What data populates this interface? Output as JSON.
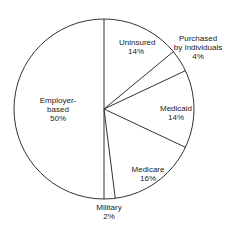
{
  "chart_data": {
    "type": "pie",
    "title": "",
    "slices": [
      {
        "label": "Uninsured",
        "value": 14
      },
      {
        "label": "Purchased by Individuals",
        "value": 4
      },
      {
        "label": "Medicaid",
        "value": 14
      },
      {
        "label": "Medicare",
        "value": 16
      },
      {
        "label": "Military",
        "value": 2
      },
      {
        "label": "Employer-based",
        "value": 50
      }
    ],
    "start_angle": "12 o'clock, clockwise",
    "legend": "none (inline labels)"
  },
  "labels": {
    "uninsured": {
      "name": "Uninsured",
      "pct": "14%"
    },
    "purchased": {
      "name1": "Purchased",
      "name2": "by Individuals",
      "pct": "4%"
    },
    "medicaid": {
      "name": "Medicaid",
      "pct": "14%"
    },
    "medicare": {
      "name": "Medicare",
      "pct": "16%"
    },
    "military": {
      "name": "Military",
      "pct": "2%"
    },
    "employer": {
      "name1": "Employer-",
      "name2": "based",
      "pct": "50%"
    }
  }
}
